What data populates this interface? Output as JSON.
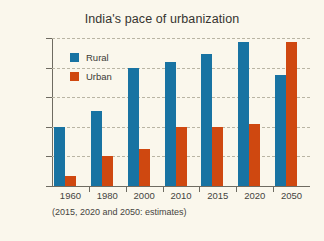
{
  "chart_data": {
    "type": "bar",
    "title": "India's pace of urbanization",
    "xlabel": "",
    "ylabel": "Population in billion",
    "categories": [
      "1960",
      "1980",
      "2000",
      "2010",
      "2015",
      "2020",
      "2050"
    ],
    "series": [
      {
        "name": "Rural",
        "color": "#1873a2",
        "values": [
          0.4,
          0.51,
          0.8,
          0.84,
          0.89,
          0.97,
          0.75
        ]
      },
      {
        "name": "Urban",
        "color": "#cf4810",
        "values": [
          0.07,
          0.2,
          0.25,
          0.4,
          0.4,
          0.42,
          0.97
        ]
      }
    ],
    "ylim": [
      0.0,
      1.0
    ],
    "y_ticks": [
      0.0,
      0.2,
      0.4,
      0.6,
      0.8,
      1.0
    ],
    "y_tick_labels": [
      "0,0",
      "0,2",
      "0,4",
      "0,6",
      "0,8",
      "1,0"
    ],
    "grid": "horizontal-dashed",
    "legend_position": "inside-top-left",
    "annotation": "(2015, 2020 and 2050: estimates)",
    "background_color": "#faf7ec"
  }
}
